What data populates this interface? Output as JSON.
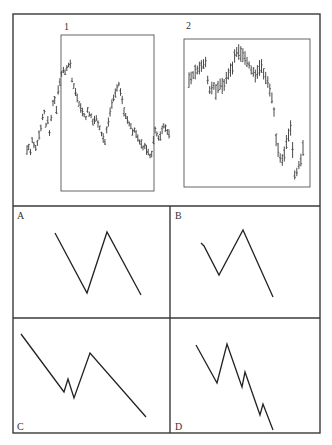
{
  "figure": {
    "top_panel": {
      "box_labels": [
        "1",
        "2"
      ]
    },
    "patterns": [
      {
        "label": "A",
        "points": [
          [
            55,
            233
          ],
          [
            87,
            293
          ],
          [
            107,
            232
          ],
          [
            141,
            295
          ]
        ]
      },
      {
        "label": "B",
        "points": [
          [
            201,
            243
          ],
          [
            204,
            246
          ],
          [
            219,
            275
          ],
          [
            243,
            230
          ],
          [
            273,
            297
          ]
        ]
      },
      {
        "label": "C",
        "points": [
          [
            21,
            334
          ],
          [
            64,
            392
          ],
          [
            68,
            379
          ],
          [
            74,
            398
          ],
          [
            90,
            353
          ],
          [
            146,
            417
          ]
        ]
      },
      {
        "label": "D",
        "points": [
          [
            196,
            345
          ],
          [
            217,
            383
          ],
          [
            227,
            344
          ],
          [
            242,
            387
          ],
          [
            245,
            372
          ],
          [
            260,
            415
          ],
          [
            263,
            404
          ],
          [
            273,
            430
          ]
        ]
      }
    ]
  },
  "chart_data": {
    "type": "bar",
    "title": "",
    "series": [
      {
        "name": "1",
        "kind": "ohlc-highlow",
        "mid_y_px": [
          150,
          147,
          152,
          140,
          145,
          148,
          143,
          135,
          128,
          117,
          112,
          125,
          120,
          133,
          118,
          103,
          100,
          110,
          90,
          82,
          74,
          70,
          72,
          68,
          65,
          64,
          80,
          86,
          92,
          98,
          104,
          108,
          112,
          115,
          118,
          110,
          114,
          116,
          122,
          120,
          118,
          124,
          128,
          134,
          138,
          142,
          130,
          122,
          112,
          104,
          98,
          93,
          88,
          84,
          92,
          100,
          112,
          116,
          120,
          124,
          126,
          132,
          130,
          134,
          138,
          142,
          144,
          148,
          146,
          150,
          152,
          156,
          154,
          140,
          130,
          134,
          138,
          136,
          130,
          126,
          128,
          132,
          134
        ],
        "range_px": 7
      },
      {
        "name": "2",
        "kind": "ohlc-highlow",
        "mid_y_px": [
          80,
          78,
          75,
          72,
          70,
          68,
          66,
          64,
          62,
          80,
          90,
          88,
          86,
          92,
          87,
          84,
          86,
          85,
          78,
          74,
          70,
          68,
          56,
          52,
          52,
          54,
          55,
          58,
          62,
          65,
          70,
          72,
          76,
          72,
          68,
          66,
          74,
          78,
          82,
          90,
          98,
          112,
          140,
          150,
          158,
          160,
          154,
          142,
          135,
          128,
          150,
          175,
          172,
          165,
          160,
          148
        ],
        "range_px": 12
      }
    ],
    "patterns": [
      "A",
      "B",
      "C",
      "D"
    ]
  }
}
